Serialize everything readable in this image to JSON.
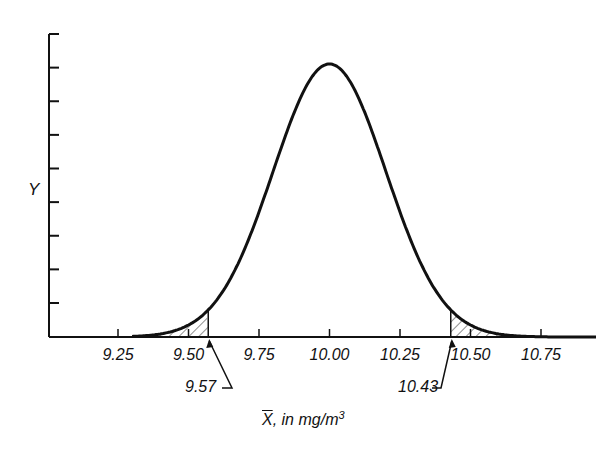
{
  "chart_data": {
    "type": "area",
    "title": "",
    "xlabel": "X̄, in mg/m³",
    "xlabel_parts": {
      "symbol": "X",
      "text": ", in mg/m",
      "sup": "3"
    },
    "ylabel": "Y",
    "x_ticks": [
      "9.25",
      "9.50",
      "9.75",
      "10.00",
      "10.25",
      "10.50",
      "10.75"
    ],
    "x_tick_values": [
      9.25,
      9.5,
      9.75,
      10.0,
      10.25,
      10.5,
      10.75
    ],
    "xlim": [
      9.0,
      10.95
    ],
    "y_tick_count": 9,
    "y_tick_labels": [],
    "grid": false,
    "legend": null,
    "series": [
      {
        "name": "Normal distribution of sample mean",
        "distribution": "normal",
        "mean": 10.0,
        "sd": 0.2
      }
    ],
    "shaded_regions": [
      {
        "name": "lower-tail",
        "from": 9.0,
        "to": 9.57,
        "pattern": "hatch"
      },
      {
        "name": "upper-tail",
        "from": 10.43,
        "to": 10.95,
        "pattern": "hatch"
      }
    ],
    "annotations": [
      {
        "text": "9.57",
        "x": 9.57,
        "arrow": true
      },
      {
        "text": "10.43",
        "x": 10.43,
        "arrow": true
      }
    ]
  }
}
